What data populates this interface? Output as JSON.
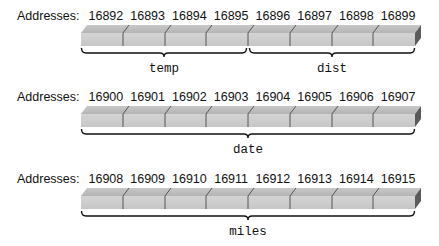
{
  "rows": [
    {
      "label": "Addresses:",
      "addresses": [
        "16892",
        "16893",
        "16894",
        "16895",
        "16896",
        "16897",
        "16898",
        "16899"
      ],
      "variables": [
        {
          "name": "temp",
          "start": 0,
          "end": 4
        },
        {
          "name": "dist",
          "start": 4,
          "end": 8
        }
      ]
    },
    {
      "label": "Addresses:",
      "addresses": [
        "16900",
        "16901",
        "16902",
        "16903",
        "16904",
        "16905",
        "16906",
        "16907"
      ],
      "variables": [
        {
          "name": "date",
          "start": 0,
          "end": 8
        }
      ]
    },
    {
      "label": "Addresses:",
      "addresses": [
        "16908",
        "16909",
        "16910",
        "16911",
        "16912",
        "16913",
        "16914",
        "16915"
      ],
      "variables": [
        {
          "name": "miles",
          "start": 0,
          "end": 8
        }
      ]
    }
  ],
  "colors": {
    "bar_front": "#cccccc",
    "bar_top": "#bdbdbd",
    "bar_side": "#5a5a5a",
    "divider": "#555555",
    "brace": "#111111"
  }
}
